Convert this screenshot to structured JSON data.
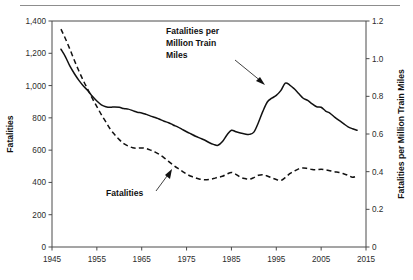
{
  "chart_data": {
    "type": "line",
    "title": "",
    "xlabel": "",
    "ylabel": "Fatalities",
    "y2label": "Fatalities per Million Train Miles",
    "xlim": [
      1945,
      2015
    ],
    "ylim": [
      0,
      1400
    ],
    "y2lim": [
      0,
      1.2
    ],
    "grid": false,
    "legend": "annotations-inline",
    "x_ticks": [
      "1945",
      "1955",
      "1965",
      "1975",
      "1985",
      "1995",
      "2005",
      "2015"
    ],
    "x_tick_values": [
      1945,
      1955,
      1965,
      1975,
      1985,
      1995,
      2005,
      2015
    ],
    "y_ticks": [
      "0",
      "200",
      "400",
      "600",
      "800",
      "1,000",
      "1,200",
      "1,400"
    ],
    "y_tick_values": [
      0,
      200,
      400,
      600,
      800,
      1000,
      1200,
      1400
    ],
    "y2_ticks": [
      "0",
      "0.2",
      "0.4",
      "0.6",
      "0.8",
      "1.0",
      "1.2"
    ],
    "y2_tick_values": [
      0,
      0.2,
      0.4,
      0.6,
      0.8,
      1.0,
      1.2
    ],
    "annotations": [
      {
        "name": "rate-annotation",
        "text": "Fatalities per Million Train Miles",
        "points_to_year": 1991,
        "points_to_value": 0.87
      },
      {
        "name": "fatalities-annotation",
        "text": "Fatalities",
        "points_to_year": 1970,
        "points_to_value": 495
      }
    ],
    "series": [
      {
        "name": "Fatalities per Million Train Miles",
        "axis": "right",
        "style": "solid",
        "x": [
          1947,
          1948,
          1949,
          1950,
          1951,
          1952,
          1953,
          1954,
          1955,
          1956,
          1957,
          1958,
          1959,
          1960,
          1961,
          1962,
          1963,
          1964,
          1965,
          1966,
          1967,
          1968,
          1969,
          1970,
          1971,
          1972,
          1973,
          1974,
          1975,
          1976,
          1977,
          1978,
          1979,
          1980,
          1981,
          1982,
          1983,
          1984,
          1985,
          1986,
          1987,
          1988,
          1989,
          1990,
          1991,
          1992,
          1993,
          1994,
          1995,
          1996,
          1997,
          1998,
          1999,
          2000,
          2001,
          2002,
          2003,
          2004,
          2005,
          2006,
          2007,
          2008,
          2009,
          2010,
          2011,
          2012,
          2013
        ],
        "values": [
          1.05,
          1.01,
          0.96,
          0.92,
          0.885,
          0.855,
          0.83,
          0.8,
          0.775,
          0.755,
          0.745,
          0.742,
          0.744,
          0.742,
          0.735,
          0.732,
          0.724,
          0.716,
          0.712,
          0.704,
          0.695,
          0.688,
          0.678,
          0.668,
          0.66,
          0.648,
          0.638,
          0.625,
          0.612,
          0.6,
          0.588,
          0.578,
          0.568,
          0.555,
          0.545,
          0.54,
          0.56,
          0.595,
          0.62,
          0.612,
          0.605,
          0.6,
          0.598,
          0.61,
          0.66,
          0.72,
          0.77,
          0.79,
          0.805,
          0.83,
          0.87,
          0.86,
          0.84,
          0.815,
          0.79,
          0.778,
          0.76,
          0.745,
          0.742,
          0.722,
          0.71,
          0.69,
          0.672,
          0.655,
          0.638,
          0.628,
          0.62
        ],
        "note": "read on right axis, 0 to 1.2"
      },
      {
        "name": "Fatalities",
        "axis": "left",
        "style": "dashed",
        "x": [
          1947,
          1948,
          1949,
          1950,
          1951,
          1952,
          1953,
          1954,
          1955,
          1956,
          1957,
          1958,
          1959,
          1960,
          1961,
          1962,
          1963,
          1964,
          1965,
          1966,
          1967,
          1968,
          1969,
          1970,
          1971,
          1972,
          1973,
          1974,
          1975,
          1976,
          1977,
          1978,
          1979,
          1980,
          1981,
          1982,
          1983,
          1984,
          1985,
          1986,
          1987,
          1988,
          1989,
          1990,
          1991,
          1992,
          1993,
          1994,
          1995,
          1996,
          1997,
          1998,
          1999,
          2000,
          2001,
          2002,
          2003,
          2004,
          2005,
          2006,
          2007,
          2008,
          2009,
          2010,
          2011,
          2012,
          2013
        ],
        "values": [
          1350,
          1290,
          1225,
          1155,
          1090,
          1030,
          975,
          920,
          870,
          820,
          775,
          730,
          695,
          665,
          640,
          625,
          615,
          612,
          614,
          610,
          600,
          588,
          572,
          552,
          530,
          508,
          488,
          470,
          452,
          438,
          428,
          420,
          416,
          418,
          424,
          432,
          438,
          452,
          462,
          450,
          432,
          424,
          420,
          430,
          444,
          448,
          440,
          428,
          418,
          412,
          430,
          454,
          470,
          484,
          490,
          486,
          480,
          478,
          482,
          478,
          472,
          466,
          462,
          454,
          444,
          432,
          440
        ],
        "note": "read on left axis, 0 to 1400"
      }
    ]
  }
}
